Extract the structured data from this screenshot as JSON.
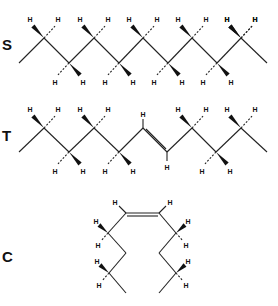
{
  "figure": {
    "atom_label": "H",
    "rows": [
      {
        "key": "S",
        "label": "S",
        "name": "saturated-chain"
      },
      {
        "key": "T",
        "label": "T",
        "name": "trans-chain"
      },
      {
        "key": "C",
        "label": "C",
        "name": "cis-chain"
      }
    ]
  }
}
